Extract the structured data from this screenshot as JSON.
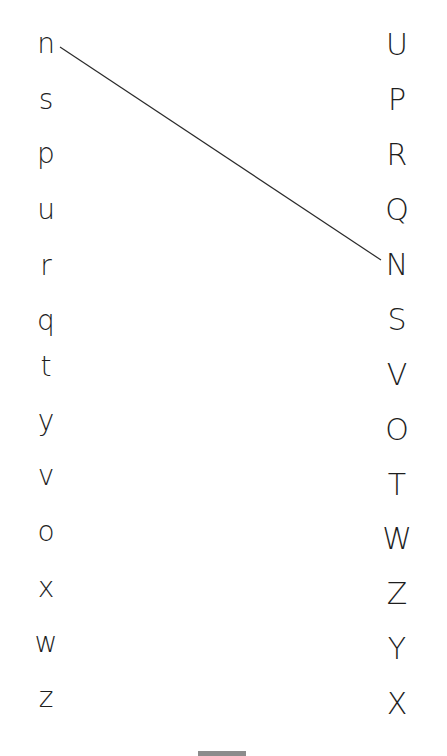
{
  "worksheet": {
    "lowercase_column": [
      "n",
      "s",
      "p",
      "u",
      "r",
      "q",
      "t",
      "y",
      "v",
      "o",
      "x",
      "w",
      "z"
    ],
    "uppercase_column": [
      "U",
      "P",
      "R",
      "Q",
      "N",
      "S",
      "V",
      "O",
      "T",
      "W",
      "Z",
      "Y",
      "X"
    ],
    "matches_drawn": [
      {
        "from": "n",
        "to": "N",
        "from_index": 0,
        "to_index": 4
      }
    ],
    "line_color": "#2a2a2a",
    "text_color": "#1e1e1e",
    "footer_tab_color": "#8c8c8c"
  }
}
